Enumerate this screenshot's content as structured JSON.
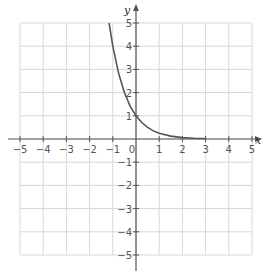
{
  "chart_data": {
    "type": "line",
    "title": "",
    "xlabel": "x",
    "ylabel": "y",
    "xlim": [
      -5,
      5
    ],
    "ylim": [
      -5,
      5
    ],
    "grid": true,
    "x_ticks": [
      -5,
      -4,
      -3,
      -2,
      -1,
      0,
      1,
      2,
      3,
      4,
      5
    ],
    "y_ticks": [
      -5,
      -4,
      -3,
      -2,
      -1,
      1,
      2,
      3,
      4,
      5
    ],
    "x_tick_labels": [
      "−5",
      "−4",
      "−3",
      "−2",
      "−1",
      "0",
      "1",
      "2",
      "3",
      "4",
      "5"
    ],
    "y_tick_labels": [
      "−5",
      "−4",
      "−3",
      "−2",
      "−1",
      "1",
      "2",
      "3",
      "4",
      "5"
    ],
    "series": [
      {
        "name": "exponential decay curve",
        "color": "#555555",
        "x": [
          -1.16,
          -1.0,
          -0.75,
          -0.5,
          -0.25,
          0,
          0.25,
          0.5,
          0.75,
          1.0,
          1.5,
          2.0,
          2.5,
          3.0
        ],
        "y": [
          5.0,
          4.0,
          2.83,
          2.0,
          1.41,
          1.0,
          0.71,
          0.5,
          0.35,
          0.25,
          0.125,
          0.06,
          0.03,
          0.02
        ]
      }
    ]
  },
  "colors": {
    "grid": "#d8d8d8",
    "axis": "#555555",
    "curve": "#555555",
    "background": "#ffffff"
  }
}
